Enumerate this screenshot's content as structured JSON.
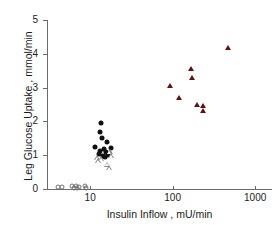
{
  "chart_data": {
    "type": "scatter",
    "title": "",
    "xlabel": "Insulin Inflow , mU/min",
    "ylabel": "Leg Glucose Uptake , mmol/min",
    "xscale": "log",
    "yscale": "linear",
    "xlim": [
      3,
      1600
    ],
    "ylim": [
      0,
      5
    ],
    "grid": false,
    "legend": "none",
    "xticks": [
      10,
      100,
      1000
    ],
    "xtick_labels": [
      "10",
      "100",
      "1000"
    ],
    "yticks": [
      0,
      1,
      2,
      3,
      4,
      5
    ],
    "ytick_labels": [
      "0",
      "1",
      "2",
      "3",
      "4",
      "5"
    ],
    "series": [
      {
        "name": "baseline-open-circles",
        "marker": "open-circle",
        "color": "#6f6f6f",
        "points": [
          {
            "x": 4.1,
            "y": 0.05
          },
          {
            "x": 4.5,
            "y": 0.05
          },
          {
            "x": 6.1,
            "y": 0.08
          },
          {
            "x": 6.4,
            "y": 0.04
          },
          {
            "x": 6.8,
            "y": 0.1
          },
          {
            "x": 7.0,
            "y": 0.02
          },
          {
            "x": 7.3,
            "y": 0.07
          },
          {
            "x": 8.6,
            "y": 0.09
          },
          {
            "x": 8.9,
            "y": 0.03
          }
        ]
      },
      {
        "name": "mid-filled-circles",
        "marker": "filled-circle",
        "color": "#111111",
        "points": [
          {
            "x": 13.5,
            "y": 1.95
          },
          {
            "x": 13.0,
            "y": 1.7
          },
          {
            "x": 13.8,
            "y": 1.5
          },
          {
            "x": 16.0,
            "y": 1.38
          },
          {
            "x": 11.3,
            "y": 1.25
          },
          {
            "x": 17.8,
            "y": 1.22
          },
          {
            "x": 13.2,
            "y": 1.13
          },
          {
            "x": 14.8,
            "y": 1.18
          },
          {
            "x": 15.6,
            "y": 1.08
          },
          {
            "x": 12.8,
            "y": 1.05
          },
          {
            "x": 14.2,
            "y": 0.98
          },
          {
            "x": 15.0,
            "y": 0.95
          },
          {
            "x": 16.6,
            "y": 1.02
          }
        ]
      },
      {
        "name": "mid-open-triangles",
        "marker": "open-triangle",
        "color": "#8a8a8a",
        "points": [
          {
            "x": 12.0,
            "y": 0.92
          },
          {
            "x": 12.6,
            "y": 0.82
          },
          {
            "x": 13.6,
            "y": 0.88
          },
          {
            "x": 17.2,
            "y": 1.1
          },
          {
            "x": 18.0,
            "y": 0.98
          },
          {
            "x": 16.2,
            "y": 0.72
          },
          {
            "x": 17.0,
            "y": 0.62
          }
        ]
      },
      {
        "name": "high-filled-triangles",
        "marker": "filled-triangle",
        "color": "#5d1111",
        "points": [
          {
            "x": 94,
            "y": 3.05
          },
          {
            "x": 118,
            "y": 2.7
          },
          {
            "x": 168,
            "y": 3.55
          },
          {
            "x": 172,
            "y": 3.28
          },
          {
            "x": 198,
            "y": 2.5
          },
          {
            "x": 232,
            "y": 2.45
          },
          {
            "x": 236,
            "y": 2.32
          },
          {
            "x": 470,
            "y": 4.18
          }
        ]
      }
    ]
  }
}
